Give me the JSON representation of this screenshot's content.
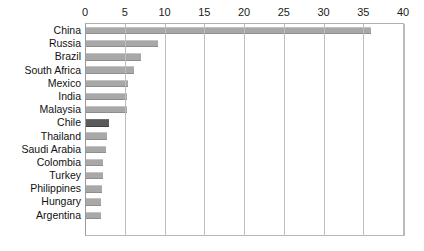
{
  "chart_data": {
    "type": "bar",
    "orientation": "horizontal",
    "title": "",
    "subtitle": "",
    "xlabel": "",
    "ylabel": "",
    "xlim": [
      0,
      40
    ],
    "x_ticks": [
      0,
      5,
      10,
      15,
      20,
      25,
      30,
      35,
      40
    ],
    "x_tick_labels": [
      "0",
      "5",
      "10",
      "15",
      "20",
      "25",
      "30",
      "35",
      "40"
    ],
    "axis_position": "top",
    "grid": true,
    "grid_axis": "x",
    "legend": false,
    "categories": [
      "China",
      "Russia",
      "Brazil",
      "South Africa",
      "Mexico",
      "India",
      "Malaysia",
      "Chile",
      "Thailand",
      "Saudi Arabia",
      "Colombia",
      "Turkey",
      "Philippines",
      "Hungary",
      "Argentina"
    ],
    "values": [
      35.8,
      9.0,
      6.9,
      6.0,
      5.3,
      5.2,
      5.1,
      2.9,
      2.6,
      2.5,
      2.2,
      2.2,
      2.0,
      1.9,
      1.9
    ],
    "highlight_category": "Chile",
    "colors": {
      "bar": "#a8a8a8",
      "bar_highlight": "#5b5b5b",
      "gridline": "#bdbdbd",
      "axis": "#9a9a9a",
      "text": "#111111",
      "background": "#ffffff"
    }
  }
}
